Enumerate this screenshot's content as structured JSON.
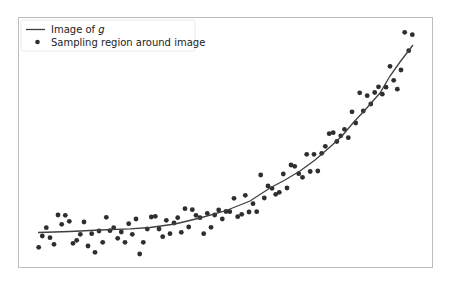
{
  "chart_data": {
    "type": "scatter",
    "title": "",
    "xlabel": "",
    "ylabel": "",
    "grid": false,
    "ticks_visible": false,
    "legend_position": "upper left",
    "legend": [
      {
        "label": "Image of g",
        "label_prefix": "Image of ",
        "label_math": "g",
        "marker": "line"
      },
      {
        "label": "Sampling region around image",
        "marker": "dot"
      }
    ],
    "pixel_frame": {
      "left": 18,
      "top": 17,
      "right": 432,
      "bottom": 267
    },
    "series": [
      {
        "name": "Image of g",
        "kind": "line",
        "color": "#404040",
        "points_px": [
          [
            38,
            232.5
          ],
          [
            70,
            231.5
          ],
          [
            100,
            230
          ],
          [
            130,
            228.8
          ],
          [
            150,
            227.5
          ],
          [
            175,
            224
          ],
          [
            200,
            218
          ],
          [
            225,
            211
          ],
          [
            250,
            201
          ],
          [
            270,
            188
          ],
          [
            285,
            180
          ],
          [
            300,
            171
          ],
          [
            315,
            160
          ],
          [
            330,
            147
          ],
          [
            342,
            136
          ],
          [
            353,
            123
          ],
          [
            365,
            110
          ],
          [
            380,
            93
          ],
          [
            390,
            76
          ],
          [
            400,
            62
          ],
          [
            413,
            45
          ]
        ]
      },
      {
        "name": "Sampling region around image",
        "kind": "scatter",
        "color": "#2e2e2e",
        "points_px": [
          [
            38.7,
            247.3
          ],
          [
            42.3,
            236
          ],
          [
            46.3,
            227.7
          ],
          [
            50,
            237.7
          ],
          [
            54,
            244.3
          ],
          [
            58,
            215
          ],
          [
            61.7,
            224.3
          ],
          [
            65.3,
            215.3
          ],
          [
            69.3,
            221.3
          ],
          [
            73,
            243.3
          ],
          [
            76.7,
            240.3
          ],
          [
            80.3,
            234.3
          ],
          [
            84,
            222
          ],
          [
            88,
            246
          ],
          [
            91.7,
            233.7
          ],
          [
            95,
            252.3
          ],
          [
            99,
            231
          ],
          [
            102.7,
            242.3
          ],
          [
            106.3,
            217.3
          ],
          [
            110,
            230.7
          ],
          [
            113.7,
            227.7
          ],
          [
            117.7,
            238.3
          ],
          [
            121.3,
            232
          ],
          [
            125,
            242.3
          ],
          [
            128.7,
            223.7
          ],
          [
            132.3,
            234.3
          ],
          [
            136,
            219
          ],
          [
            139.7,
            254
          ],
          [
            143.3,
            242.3
          ],
          [
            147.3,
            229
          ],
          [
            151.3,
            217
          ],
          [
            155.3,
            216.3
          ],
          [
            159,
            229
          ],
          [
            162.7,
            236.7
          ],
          [
            166.3,
            220.3
          ],
          [
            170,
            233.7
          ],
          [
            174,
            223
          ],
          [
            177.7,
            217.7
          ],
          [
            181.3,
            232.3
          ],
          [
            185,
            208.7
          ],
          [
            188.7,
            227
          ],
          [
            192.3,
            209.7
          ],
          [
            196,
            215.3
          ],
          [
            200,
            217.7
          ],
          [
            203.7,
            233.7
          ],
          [
            207.3,
            213.3
          ],
          [
            211,
            227.3
          ],
          [
            214.7,
            215
          ],
          [
            218.7,
            210
          ],
          [
            222.3,
            219
          ],
          [
            226,
            211.5
          ],
          [
            229.8,
            211.7
          ],
          [
            234,
            198.3
          ],
          [
            237.7,
            216.7
          ],
          [
            241.7,
            214.3
          ],
          [
            245.3,
            195.3
          ],
          [
            249,
            212
          ],
          [
            253,
            203.7
          ],
          [
            256.7,
            211.7
          ],
          [
            260.7,
            175
          ],
          [
            264.3,
            198
          ],
          [
            268,
            186
          ],
          [
            272,
            188.3
          ],
          [
            275.7,
            194.3
          ],
          [
            279.3,
            192.3
          ],
          [
            283.3,
            174
          ],
          [
            287,
            188
          ],
          [
            291,
            165
          ],
          [
            294.7,
            166.3
          ],
          [
            298.7,
            173.7
          ],
          [
            302.5,
            177.3
          ],
          [
            306.7,
            154.3
          ],
          [
            310.2,
            171.5
          ],
          [
            314,
            154.3
          ],
          [
            317.8,
            171
          ],
          [
            321.7,
            153.3
          ],
          [
            325.3,
            146.3
          ],
          [
            329.2,
            133.7
          ],
          [
            333.2,
            132.7
          ],
          [
            336.8,
            141.5
          ],
          [
            340.8,
            135.8
          ],
          [
            344.5,
            129.3
          ],
          [
            348.3,
            137.7
          ],
          [
            352,
            111.8
          ],
          [
            355.7,
            123
          ],
          [
            359.7,
            92.8
          ],
          [
            363.3,
            111
          ],
          [
            367.2,
            95.7
          ],
          [
            370.8,
            104
          ],
          [
            374.7,
            92.5
          ],
          [
            378.5,
            86.8
          ],
          [
            382.3,
            94.2
          ],
          [
            386,
            87.2
          ],
          [
            390,
            66.3
          ],
          [
            393.7,
            80.3
          ],
          [
            397.3,
            89.2
          ],
          [
            401,
            70
          ],
          [
            404.7,
            32.3
          ],
          [
            408.7,
            50.7
          ],
          [
            412.3,
            34.7
          ]
        ]
      }
    ]
  }
}
